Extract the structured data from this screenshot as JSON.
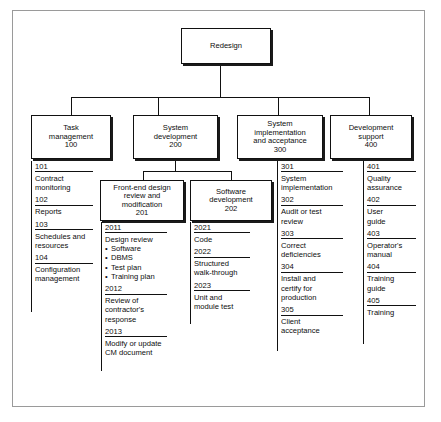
{
  "root": {
    "label": "Redesign",
    "lines": [
      "Redesign"
    ]
  },
  "level2": [
    {
      "id": "100",
      "lines": [
        "Task",
        "management",
        "100"
      ]
    },
    {
      "id": "200",
      "lines": [
        "System",
        "development",
        "200"
      ]
    },
    {
      "id": "300",
      "lines": [
        "System",
        "implementation",
        "and acceptance",
        "300"
      ]
    },
    {
      "id": "400",
      "lines": [
        "Development",
        "support",
        "400"
      ]
    }
  ],
  "level3": [
    {
      "id": "201",
      "lines": [
        "Front-end design",
        "review and",
        "modification",
        "201"
      ]
    },
    {
      "id": "202",
      "lines": [
        "Software",
        "development",
        "202"
      ]
    }
  ],
  "lists": {
    "task_management": [
      {
        "code": "101",
        "lines": [
          "Contract",
          "monitoring"
        ]
      },
      {
        "code": "102",
        "lines": [
          "Reports"
        ]
      },
      {
        "code": "103",
        "lines": [
          "Schedules and",
          "resources"
        ]
      },
      {
        "code": "104",
        "lines": [
          "Configuration",
          "management"
        ]
      }
    ],
    "front_end_design": [
      {
        "code": "2011",
        "lines": [
          "Design review"
        ],
        "bullets": [
          "Software",
          "DBMS",
          "Test plan",
          "Training plan"
        ]
      },
      {
        "code": "2012",
        "lines": [
          "Review of",
          "contractor's",
          "response"
        ]
      },
      {
        "code": "2013",
        "lines": [
          "Modify or update",
          "CM document"
        ]
      }
    ],
    "software_development": [
      {
        "code": "2021",
        "lines": [
          "Code"
        ]
      },
      {
        "code": "2022",
        "lines": [
          "Structured",
          "walk-through"
        ]
      },
      {
        "code": "2023",
        "lines": [
          "Unit and",
          "module test"
        ]
      }
    ],
    "system_implementation": [
      {
        "code": "301",
        "lines": [
          "System",
          "implementation"
        ]
      },
      {
        "code": "302",
        "lines": [
          "Audit or test",
          "review"
        ]
      },
      {
        "code": "303",
        "lines": [
          "Correct",
          "deficiencies"
        ]
      },
      {
        "code": "304",
        "lines": [
          "Install and",
          "certify for",
          "production"
        ]
      },
      {
        "code": "305",
        "lines": [
          "Client",
          "acceptance"
        ]
      }
    ],
    "development_support": [
      {
        "code": "401",
        "lines": [
          "Quality",
          "assurance"
        ]
      },
      {
        "code": "402",
        "lines": [
          "User",
          "guide"
        ]
      },
      {
        "code": "403",
        "lines": [
          "Operator's",
          "manual"
        ]
      },
      {
        "code": "404",
        "lines": [
          "Training",
          "guide"
        ]
      },
      {
        "code": "405",
        "lines": [
          "Training"
        ]
      }
    ]
  },
  "colors": {
    "line": "#111111",
    "frame": "#9a9a9a",
    "background": "#ffffff"
  }
}
